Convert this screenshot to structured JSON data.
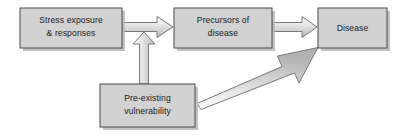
{
  "diagram": {
    "background_color": "#ffffff",
    "node_fill_color": "#d2d2d2",
    "node_border_color": "#4a4a4a",
    "arrow_fill_color": "#d8d8d8",
    "arrow_border_color": "#6b6b6b",
    "text_color": "#1a1a1a",
    "nodes": [
      {
        "id": "stress-exposure",
        "line1": "Stress exposure",
        "line2": "& responses",
        "x": 20,
        "y": 8,
        "width": 102,
        "height": 40
      },
      {
        "id": "precursors",
        "line1": "Precursors of",
        "line2": "disease",
        "x": 174,
        "y": 8,
        "width": 98,
        "height": 40
      },
      {
        "id": "disease",
        "line1": "Disease",
        "line2": "",
        "x": 318,
        "y": 8,
        "width": 69,
        "height": 40
      },
      {
        "id": "pre-existing-vulnerability",
        "line1": "Pre-existing",
        "line2": "vulnerability",
        "x": 100,
        "y": 84,
        "width": 95,
        "height": 43
      }
    ],
    "arrows": [
      {
        "id": "stress-to-precursors",
        "from": "stress-exposure",
        "to": "precursors",
        "direction": "right"
      },
      {
        "id": "precursors-to-disease",
        "from": "precursors",
        "to": "disease",
        "direction": "right"
      },
      {
        "id": "vulnerability-to-stress-link",
        "from": "pre-existing-vulnerability",
        "to": "stress-to-precursors",
        "direction": "up"
      },
      {
        "id": "vulnerability-to-disease",
        "from": "pre-existing-vulnerability",
        "to": "disease",
        "direction": "diagonal-up-right"
      }
    ]
  }
}
